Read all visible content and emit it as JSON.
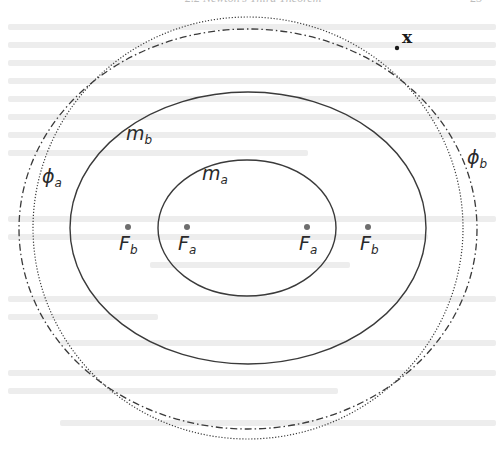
{
  "page": {
    "header_title": "2.2 Newton's Third Theorem",
    "header_page_number": "23"
  },
  "diagram": {
    "ellipses": [
      {
        "id": "ellipse-inner",
        "label": "m_a",
        "style": "solid",
        "cx": 247,
        "cy": 228,
        "rx": 89,
        "ry": 68
      },
      {
        "id": "ellipse-outer",
        "label": "m_b",
        "style": "solid",
        "cx": 248,
        "cy": 228,
        "rx": 178,
        "ry": 136
      },
      {
        "id": "equipotential-dotted",
        "label": "phi_a",
        "style": "dotted",
        "cx": 248,
        "cy": 228,
        "rx": 215,
        "ry": 211
      },
      {
        "id": "equipotential-dashdot",
        "label": "phi_b",
        "style": "dash-dot",
        "cx": 248,
        "cy": 229,
        "rx": 229,
        "ry": 200
      }
    ],
    "labels": {
      "m_b": {
        "base": "m",
        "sub": "b"
      },
      "m_a": {
        "base": "m",
        "sub": "a"
      },
      "phi_a": {
        "base": "ϕ",
        "sub": "a"
      },
      "phi_b": {
        "base": "ϕ",
        "sub": "b"
      },
      "point": "x"
    },
    "foci": [
      {
        "base": "F",
        "sub": "b",
        "x": 127
      },
      {
        "base": "F",
        "sub": "a",
        "x": 186
      },
      {
        "base": "F",
        "sub": "a",
        "x": 307
      },
      {
        "base": "F",
        "sub": "b",
        "x": 368
      }
    ],
    "point_x": {
      "x": 397,
      "y": 48
    },
    "colors": {
      "line": "#3a3a3a",
      "focus_dot": "#6e6e6e",
      "ghost_text": "#ededed"
    }
  }
}
